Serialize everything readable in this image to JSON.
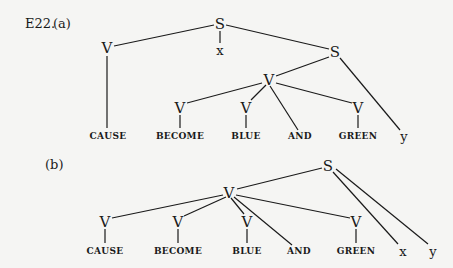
{
  "example_label": "E22.",
  "diagram_a": {
    "label": "(a)",
    "nodes": {
      "s_top": "S",
      "v_cause": "V",
      "x": "x",
      "s_inner": "S",
      "v_mid": "V",
      "v_become": "V",
      "v_blue": "V",
      "v_green": "V"
    },
    "leaves": [
      "CAUSE",
      "BECOME",
      "BLUE",
      "AND",
      "GREEN",
      "y"
    ]
  },
  "diagram_b": {
    "label": "(b)",
    "nodes": {
      "s_top": "S",
      "v_mid": "V",
      "v_cause": "V",
      "v_become": "V",
      "v_blue": "V",
      "v_green": "V"
    },
    "leaves": [
      "CAUSE",
      "BECOME",
      "BLUE",
      "AND",
      "GREEN",
      "x",
      "y"
    ]
  }
}
